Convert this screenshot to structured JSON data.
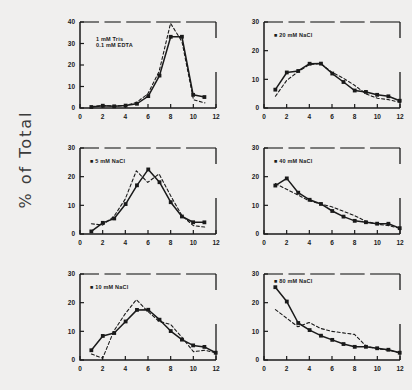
{
  "figure": {
    "ylabel": "% of Total",
    "background": "#f0efee",
    "ink": "#1a1a1a"
  },
  "chart_data": [
    {
      "type": "line",
      "title": "1 mM Tris / 0.1 mM EDTA",
      "label_lines": [
        "1 mM Tris",
        "0.1 mM EDTA"
      ],
      "xlabel": "",
      "ylabel": "% of Total",
      "xlim": [
        0,
        12
      ],
      "ylim": [
        0,
        40
      ],
      "xticks": [
        0,
        2,
        4,
        6,
        8,
        10,
        12
      ],
      "yticks": [
        0,
        10,
        20,
        30,
        40
      ],
      "grid": false,
      "legend": "none",
      "x": [
        1,
        2,
        3,
        4,
        5,
        6,
        7,
        8,
        9,
        10,
        11
      ],
      "series": [
        {
          "name": "solid",
          "style": "solid-with-square-markers",
          "values": [
            0.6,
            1.2,
            0.9,
            1.2,
            2.0,
            5.5,
            15.0,
            33.0,
            33.0,
            6.0,
            5.0
          ]
        },
        {
          "name": "dashed",
          "style": "dashed",
          "values": [
            0.5,
            1.0,
            0.8,
            1.0,
            2.5,
            6.5,
            17.0,
            39.5,
            31.0,
            4.0,
            2.5
          ]
        }
      ]
    },
    {
      "type": "line",
      "title": "20 mM NaCl",
      "label_lines": [
        "20 mM NaCl"
      ],
      "xlabel": "",
      "ylabel": "% of Total",
      "xlim": [
        0,
        12
      ],
      "ylim": [
        0,
        30
      ],
      "xticks": [
        0,
        2,
        4,
        6,
        8,
        10,
        12
      ],
      "yticks": [
        0,
        10,
        20,
        30
      ],
      "grid": false,
      "legend": "none",
      "x": [
        1,
        2,
        3,
        4,
        5,
        6,
        7,
        8,
        9,
        10,
        11,
        12
      ],
      "series": [
        {
          "name": "solid",
          "style": "solid-with-square-markers",
          "values": [
            6.5,
            12.5,
            13.0,
            15.5,
            15.5,
            12.0,
            9.0,
            6.0,
            5.5,
            4.5,
            4.0,
            2.5
          ]
        },
        {
          "name": "dashed",
          "style": "dashed",
          "values": [
            4.0,
            9.5,
            12.5,
            15.0,
            15.5,
            12.5,
            10.5,
            8.0,
            5.0,
            3.5,
            3.0,
            2.0
          ]
        }
      ]
    },
    {
      "type": "line",
      "title": "5 mM NaCl",
      "label_lines": [
        "5 mM NaCl"
      ],
      "xlabel": "",
      "ylabel": "% of Total",
      "xlim": [
        0,
        12
      ],
      "ylim": [
        0,
        30
      ],
      "xticks": [
        0,
        2,
        4,
        6,
        8,
        10,
        12
      ],
      "yticks": [
        0,
        10,
        20,
        30
      ],
      "grid": false,
      "legend": "none",
      "x": [
        1,
        2,
        3,
        4,
        5,
        6,
        7,
        8,
        9,
        10,
        11
      ],
      "series": [
        {
          "name": "solid",
          "style": "solid-with-square-markers",
          "values": [
            1.0,
            4.0,
            5.5,
            10.5,
            17.0,
            22.5,
            18.0,
            11.0,
            6.0,
            4.0,
            4.0
          ]
        },
        {
          "name": "dashed",
          "style": "dashed",
          "values": [
            3.5,
            3.0,
            6.0,
            12.0,
            22.0,
            18.0,
            21.0,
            13.5,
            6.5,
            3.0,
            2.5
          ]
        }
      ]
    },
    {
      "type": "line",
      "title": "40 mM NaCl",
      "label_lines": [
        "40 mM NaCl"
      ],
      "xlabel": "",
      "ylabel": "% of Total",
      "xlim": [
        0,
        12
      ],
      "ylim": [
        0,
        30
      ],
      "xticks": [
        0,
        2,
        4,
        6,
        8,
        10,
        12
      ],
      "yticks": [
        0,
        10,
        20,
        30
      ],
      "grid": false,
      "legend": "none",
      "x": [
        1,
        2,
        3,
        4,
        5,
        6,
        7,
        8,
        9,
        10,
        11,
        12
      ],
      "series": [
        {
          "name": "solid",
          "style": "solid-with-square-markers",
          "values": [
            17.0,
            19.5,
            14.5,
            12.0,
            10.5,
            8.0,
            6.0,
            4.5,
            4.0,
            3.5,
            3.5,
            2.0
          ]
        },
        {
          "name": "dashed",
          "style": "dashed",
          "values": [
            17.5,
            15.5,
            13.5,
            11.5,
            10.5,
            9.5,
            8.0,
            6.5,
            4.5,
            3.5,
            3.0,
            2.0
          ]
        }
      ]
    },
    {
      "type": "line",
      "title": "10 mM NaCl",
      "label_lines": [
        "10 mM NaCl"
      ],
      "xlabel": "",
      "ylabel": "% of Total",
      "xlim": [
        0,
        12
      ],
      "ylim": [
        0,
        30
      ],
      "xticks": [
        0,
        2,
        4,
        6,
        8,
        10,
        12
      ],
      "yticks": [
        0,
        10,
        20,
        30
      ],
      "grid": false,
      "legend": "none",
      "x": [
        1,
        2,
        3,
        4,
        5,
        6,
        7,
        8,
        9,
        10,
        11,
        12
      ],
      "series": [
        {
          "name": "solid",
          "style": "solid-with-square-markers",
          "values": [
            3.5,
            8.5,
            9.5,
            13.5,
            17.5,
            17.5,
            14.0,
            10.0,
            7.0,
            5.0,
            4.5,
            2.5
          ]
        },
        {
          "name": "dashed",
          "style": "dashed",
          "values": [
            2.0,
            0.5,
            10.0,
            16.0,
            21.0,
            17.0,
            13.5,
            12.5,
            8.0,
            3.0,
            3.5,
            2.5
          ]
        }
      ]
    },
    {
      "type": "line",
      "title": "80 mM NaCl",
      "label_lines": [
        "80 mM NaCl"
      ],
      "xlabel": "",
      "ylabel": "% of Total",
      "xlim": [
        0,
        12
      ],
      "ylim": [
        0,
        30
      ],
      "xticks": [
        0,
        2,
        4,
        6,
        8,
        10,
        12
      ],
      "yticks": [
        0,
        10,
        20,
        30
      ],
      "grid": false,
      "legend": "none",
      "x": [
        1,
        2,
        3,
        4,
        5,
        6,
        7,
        8,
        9,
        10,
        11,
        12
      ],
      "series": [
        {
          "name": "solid",
          "style": "solid-with-square-markers",
          "values": [
            25.5,
            20.5,
            13.0,
            10.5,
            8.5,
            7.0,
            5.5,
            4.5,
            4.5,
            4.0,
            3.5,
            2.5
          ]
        },
        {
          "name": "dashed",
          "style": "dashed",
          "values": [
            17.5,
            14.5,
            11.5,
            13.0,
            11.0,
            10.0,
            9.5,
            9.0,
            5.0,
            4.0,
            3.5,
            2.5
          ]
        }
      ]
    }
  ]
}
